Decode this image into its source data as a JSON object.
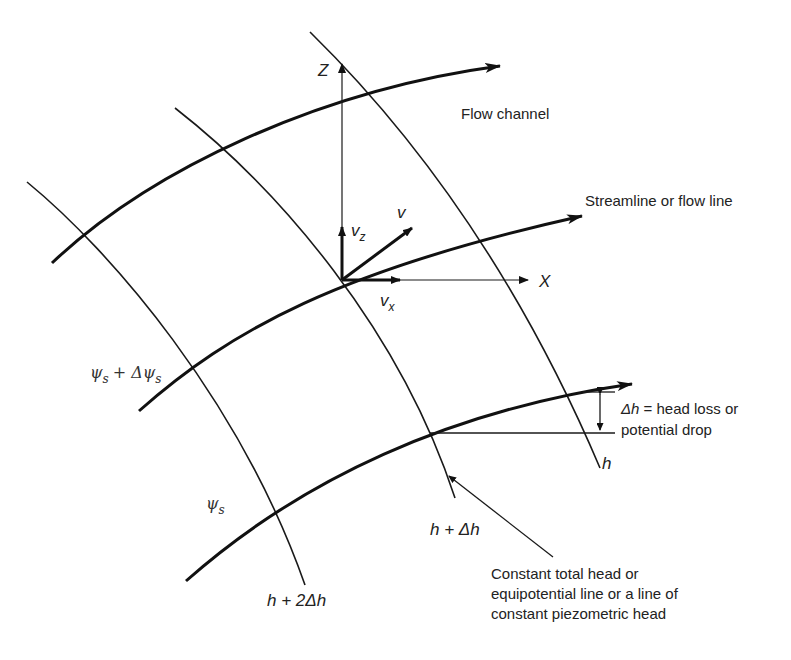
{
  "diagram": {
    "type": "flow-net element",
    "axes": {
      "z_label": "Z",
      "x_label": "X"
    },
    "velocity": {
      "v": "v",
      "vz_main": "v",
      "vz_sub": "z",
      "vx_main": "v",
      "vx_sub": "x"
    },
    "labels": {
      "flow_channel": "Flow channel",
      "streamline": "Streamline or flow line",
      "delta_h_line1": "= head loss or",
      "delta_h_symbol": "Δh",
      "delta_h_line2": "potential drop",
      "h": "h",
      "h_plus_dh": "h + Δh",
      "h_plus_2dh": "h + 2Δh",
      "psi": "ψ",
      "psi_sub": "s",
      "psi_plus": "+ Δψ",
      "psi_plus_sub": "s",
      "equipotential_1": "Constant total head or",
      "equipotential_2": "equipotential line or a line of",
      "equipotential_3": "constant piezometric head"
    },
    "colors": {
      "line": "#111111",
      "background": "#ffffff"
    }
  }
}
